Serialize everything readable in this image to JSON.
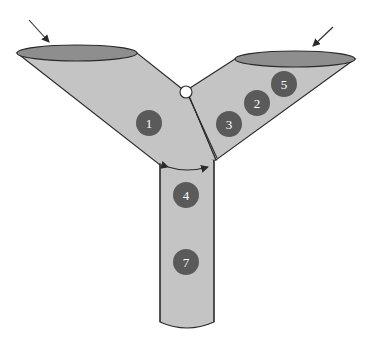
{
  "diagram": {
    "colors": {
      "tube_fill": "#c4c4c4",
      "opening_fill": "#8e8e8e",
      "outline": "#2a2a2a",
      "marker_fill": "#5a5a5a",
      "marker_text": "#ffffff",
      "pivot_fill": "#ffffff"
    },
    "inlets": [
      {
        "name": "left-inlet",
        "arrow": "inflow-arrow"
      },
      {
        "name": "right-inlet",
        "arrow": "inflow-arrow"
      }
    ],
    "markers": [
      {
        "label": "1",
        "x": 149,
        "y": 123
      },
      {
        "label": "3",
        "x": 229,
        "y": 124
      },
      {
        "label": "2",
        "x": 257,
        "y": 103
      },
      {
        "label": "5",
        "x": 284,
        "y": 84
      },
      {
        "label": "4",
        "x": 186,
        "y": 195
      },
      {
        "label": "7",
        "x": 186,
        "y": 262
      }
    ],
    "pivot": {
      "name": "hinge-valve"
    },
    "angle_indicator": {
      "name": "double-headed-angle-arrow"
    }
  }
}
